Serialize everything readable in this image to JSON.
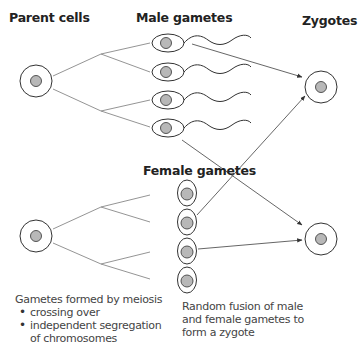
{
  "headings": {
    "parent_cells": "Parent cells",
    "male_gametes": "Male gametes",
    "zygotes": "Zygotes",
    "female_gametes": "Female gametes"
  },
  "captions": {
    "meiosis": {
      "title": "Gametes formed by meiosis",
      "bullets": [
        "crossing over",
        "independent segregation"
      ],
      "continuation": "of chromosomes"
    },
    "fusion": {
      "lines": [
        "Random fusion of male",
        "and female gametes to",
        "form a zygote"
      ]
    }
  },
  "colors": {
    "outline": "#333333",
    "nucleus_fill": "#b8b8b8",
    "line": "#777777",
    "text": "#444444",
    "heading": "#222222"
  },
  "diagram": {
    "parent_cells": [
      {
        "cx": 36,
        "cy": 81
      },
      {
        "cx": 36,
        "cy": 236
      }
    ],
    "male_gametes": [
      {
        "cx": 168,
        "cy": 43
      },
      {
        "cx": 168,
        "cy": 72
      },
      {
        "cx": 168,
        "cy": 100
      },
      {
        "cx": 168,
        "cy": 128
      }
    ],
    "female_gametes": [
      {
        "cx": 187,
        "cy": 193
      },
      {
        "cx": 187,
        "cy": 222
      },
      {
        "cx": 187,
        "cy": 251
      },
      {
        "cx": 187,
        "cy": 280
      }
    ],
    "zygotes": [
      {
        "cx": 321,
        "cy": 87
      },
      {
        "cx": 321,
        "cy": 239
      }
    ],
    "arrows": [
      {
        "from": "male_gamete_1",
        "to": "zygote_1"
      },
      {
        "from": "female_gamete_2",
        "to": "zygote_1"
      },
      {
        "from": "male_gamete_4",
        "to": "zygote_2"
      },
      {
        "from": "female_gamete_3",
        "to": "zygote_2"
      }
    ]
  }
}
